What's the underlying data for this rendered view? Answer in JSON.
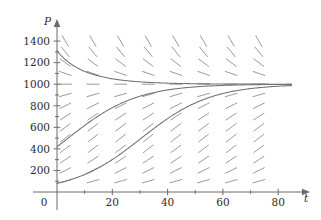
{
  "figure": {
    "name": "direction-field-logistic",
    "background": "#ffffff",
    "width": 321,
    "height": 220
  },
  "chart_data": {
    "type": "line",
    "title": "",
    "subtitle": "",
    "xlabel": "t",
    "ylabel": "P",
    "xlim": [
      -6,
      90
    ],
    "ylim": [
      -90,
      1500
    ],
    "grid": false,
    "legend": null,
    "axis": {
      "x_axis_position_value": 0,
      "y_axis_position_value": 0,
      "x_ticks": [
        20,
        40,
        60,
        80
      ],
      "x_tick_labels": [
        "20",
        "40",
        "60",
        "80"
      ],
      "y_ticks": [
        200,
        400,
        600,
        800,
        1000,
        1200,
        1400
      ],
      "y_tick_labels": [
        "200",
        "400",
        "600",
        "800",
        "1000",
        "1200",
        "1400"
      ],
      "origin_label": "0",
      "x_minor_ticks": [
        10,
        30,
        50,
        70
      ],
      "y_minor_ticks": [
        100,
        300,
        500,
        700,
        900,
        1100,
        1300
      ]
    },
    "equation": {
      "description": "logistic growth direction field",
      "carrying_capacity": 1000,
      "growth_rate_k": 0.08
    },
    "direction_field": {
      "kind": "slope-field",
      "t_samples": [
        3,
        13,
        23,
        33,
        43,
        53,
        63,
        73
      ],
      "p_samples": [
        100,
        200,
        300,
        400,
        500,
        600,
        700,
        800,
        900,
        1000,
        1100,
        1200,
        1300,
        1400
      ],
      "segment_pixel_length": 13,
      "color": "#8e8e8e",
      "equilibrium_value": 1000,
      "note": "slopes horizontal at P=1000, positive below, negative above"
    },
    "series": [
      {
        "name": "solution-upper",
        "initial_value_P0": 1310,
        "approach": "decays toward P = 1000",
        "color": "#707070"
      },
      {
        "name": "solution-middle",
        "initial_value_P0": 420,
        "approach": "rises toward P = 1000",
        "color": "#707070"
      },
      {
        "name": "solution-lower",
        "initial_value_P0": 80,
        "approach": "rises toward P = 1000",
        "color": "#707070"
      }
    ]
  }
}
